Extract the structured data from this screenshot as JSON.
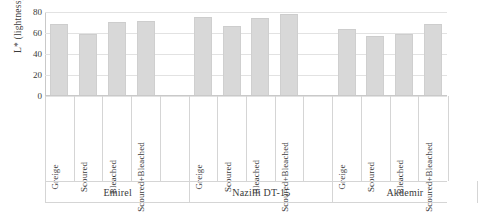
{
  "chart_data": {
    "type": "bar",
    "title": "",
    "xlabel": "",
    "ylabel": "L* (lightness)",
    "ylim": [
      0,
      80
    ],
    "yticks": [
      0,
      20,
      40,
      60,
      80
    ],
    "grid": true,
    "legend": "none",
    "categories": [
      "Greige",
      "Scoured",
      "Bleached",
      "Scoured+Bleached"
    ],
    "groups": [
      "Emirel",
      "Nazilli DT-15",
      "Akdemir"
    ],
    "series": [
      {
        "name": "Emirel",
        "values": [
          67,
          57,
          69,
          70
        ]
      },
      {
        "name": "Nazilli DT-15",
        "values": [
          73,
          65,
          72,
          76
        ]
      },
      {
        "name": "Akdemir",
        "values": [
          62,
          55,
          57,
          67
        ]
      }
    ],
    "bar_color": "#d8d8d8",
    "gridline_color": "#e2e2e2",
    "axis_color": "#c9c9c9"
  },
  "axis": {
    "y_title": "L* (lightness)",
    "y_ticks": [
      "0",
      "20",
      "40",
      "60",
      "80"
    ]
  },
  "bars": [
    {
      "label": "Greige",
      "group": "Emirel",
      "value": 67
    },
    {
      "label": "Scoured",
      "group": "Emirel",
      "value": 57
    },
    {
      "label": "Bleached",
      "group": "Emirel",
      "value": 69
    },
    {
      "label": "Scoured+Bleached",
      "group": "Emirel",
      "value": 70
    },
    {
      "label": "Greige",
      "group": "Nazilli DT-15",
      "value": 73
    },
    {
      "label": "Scoured",
      "group": "Nazilli DT-15",
      "value": 65
    },
    {
      "label": "Bleached",
      "group": "Nazilli DT-15",
      "value": 72
    },
    {
      "label": "Scoured+Bleached",
      "group": "Nazilli DT-15",
      "value": 76
    },
    {
      "label": "Greige",
      "group": "Akdemir",
      "value": 62
    },
    {
      "label": "Scoured",
      "group": "Akdemir",
      "value": 55
    },
    {
      "label": "Bleached",
      "group": "Akdemir",
      "value": 57
    },
    {
      "label": "Scoured+Bleached",
      "group": "Akdemir",
      "value": 67
    }
  ],
  "groups": [
    {
      "name": "Emirel"
    },
    {
      "name": "Nazilli DT-15"
    },
    {
      "name": "Akdemir"
    }
  ]
}
